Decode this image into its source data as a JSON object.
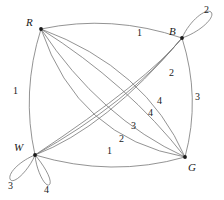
{
  "figure": {
    "name": "multigraph-with-labeled-edges-and-loops",
    "type": "graph-diagram",
    "background_color": "#ffffff",
    "edge_color": "#777777",
    "vertex_color": "#1a1a1a",
    "label_color": "#1a1a1a",
    "width": 224,
    "height": 200
  },
  "vertices": [
    {
      "id": "R",
      "label": "R",
      "x": 41,
      "y": 29,
      "label_x": 26,
      "label_y": 17
    },
    {
      "id": "B",
      "label": "B",
      "x": 182,
      "y": 38,
      "label_x": 169,
      "label_y": 26
    },
    {
      "id": "W",
      "label": "W",
      "x": 35,
      "y": 155,
      "label_x": 16,
      "label_y": 142
    },
    {
      "id": "G",
      "label": "G",
      "x": 185,
      "y": 157,
      "label_x": 188,
      "label_y": 162
    }
  ],
  "edges": [
    {
      "from": "R",
      "to": "B",
      "label": "1",
      "label_x": 137,
      "label_y": 28
    },
    {
      "from": "R",
      "to": "W",
      "label": "1",
      "label_x": 13,
      "label_y": 86
    },
    {
      "from": "B",
      "to": "G",
      "label": "3",
      "label_x": 195,
      "label_y": 92
    },
    {
      "from": "W",
      "to": "G",
      "label": "1",
      "label_x": 107,
      "label_y": 146
    },
    {
      "from": "W",
      "to": "B",
      "label": "2",
      "label_x": 169,
      "label_y": 68
    },
    {
      "from": "R",
      "to": "G",
      "label": "4",
      "label_x": 157,
      "label_y": 96
    },
    {
      "from": "R",
      "to": "G",
      "label": "4",
      "label_x": 148,
      "label_y": 108
    },
    {
      "from": "W",
      "to": "B",
      "label": "3",
      "label_x": 131,
      "label_y": 121
    },
    {
      "from": "R",
      "to": "G",
      "label": "2",
      "label_x": 119,
      "label_y": 134
    }
  ],
  "loops": [
    {
      "at": "B",
      "label": "2",
      "label_x": 204,
      "label_y": 7,
      "direction": "up-right"
    },
    {
      "at": "W",
      "label": "3",
      "label_x": 9,
      "label_y": 181,
      "direction": "down-left"
    },
    {
      "at": "W",
      "label": "4",
      "label_x": 44,
      "label_y": 185,
      "direction": "down-right"
    }
  ]
}
